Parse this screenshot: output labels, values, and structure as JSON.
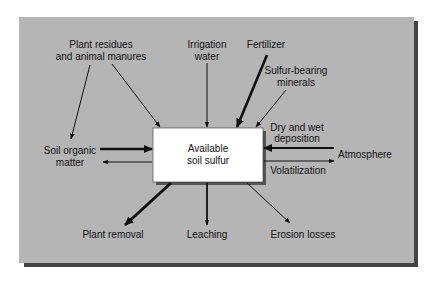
{
  "diagram": {
    "center_node": {
      "line1": "Available",
      "line2": "soil sulfur"
    },
    "nodes": {
      "plant_residues": {
        "line1": "Plant residues",
        "line2": "and animal manures"
      },
      "irrigation": {
        "line1": "Irrigation",
        "line2": "water"
      },
      "fertilizer": {
        "line1": "Fertilizer"
      },
      "sulfur_minerals": {
        "line1": "Sulfur-bearing",
        "line2": "minerals"
      },
      "soil_organic_matter": {
        "line1": "Soil organic",
        "line2": "matter"
      },
      "atmosphere": {
        "line1": "Atmosphere"
      },
      "plant_removal": {
        "line1": "Plant removal"
      },
      "leaching": {
        "line1": "Leaching"
      },
      "erosion": {
        "line1": "Erosion losses"
      }
    },
    "flow_labels": {
      "deposition_line1": "Dry and wet",
      "deposition_line2": "deposition",
      "volatilization": "Volatilization"
    },
    "edges": [
      {
        "from": "Plant residues and animal manures",
        "to": "Soil organic matter",
        "weight": "thin"
      },
      {
        "from": "Plant residues and animal manures",
        "to": "Available soil sulfur",
        "weight": "thin"
      },
      {
        "from": "Irrigation water",
        "to": "Available soil sulfur",
        "weight": "thin"
      },
      {
        "from": "Fertilizer",
        "to": "Available soil sulfur",
        "weight": "thick"
      },
      {
        "from": "Sulfur-bearing minerals",
        "to": "Available soil sulfur",
        "weight": "thin"
      },
      {
        "from": "Soil organic matter",
        "to": "Available soil sulfur",
        "weight": "thick"
      },
      {
        "from": "Available soil sulfur",
        "to": "Soil organic matter",
        "weight": "thin"
      },
      {
        "from": "Atmosphere",
        "to": "Available soil sulfur",
        "label": "Dry and wet deposition",
        "weight": "thick"
      },
      {
        "from": "Available soil sulfur",
        "to": "Atmosphere",
        "label": "Volatilization",
        "weight": "thin"
      },
      {
        "from": "Available soil sulfur",
        "to": "Plant removal",
        "weight": "thick"
      },
      {
        "from": "Available soil sulfur",
        "to": "Leaching",
        "weight": "medium"
      },
      {
        "from": "Available soil sulfur",
        "to": "Erosion losses",
        "weight": "thin"
      }
    ],
    "colors": {
      "panel": "#b5b5b5",
      "shadow": "#444444",
      "box": "#ffffff",
      "ink": "#111111"
    }
  }
}
